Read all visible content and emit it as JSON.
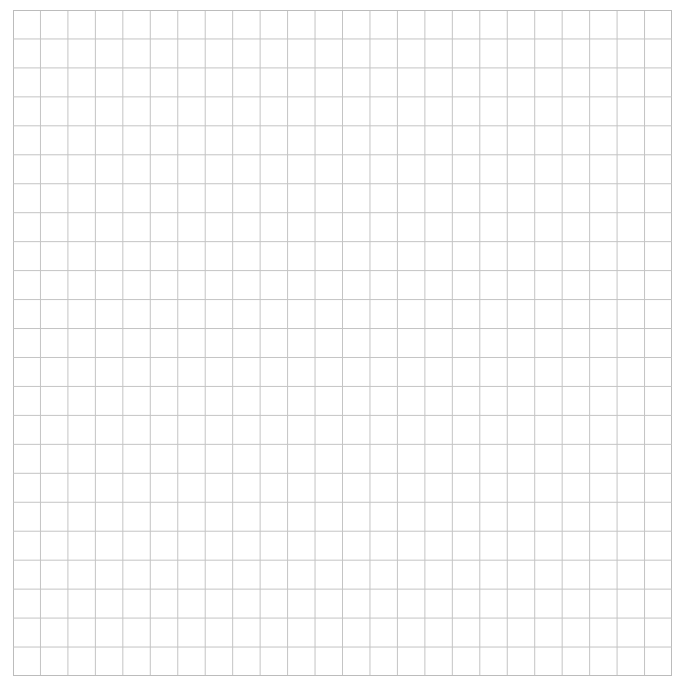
{
  "grid": {
    "columns": 24,
    "rows": 23,
    "line_color": "#c4c4c4",
    "border_color": "#bcbcbc",
    "background": "#ffffff"
  }
}
